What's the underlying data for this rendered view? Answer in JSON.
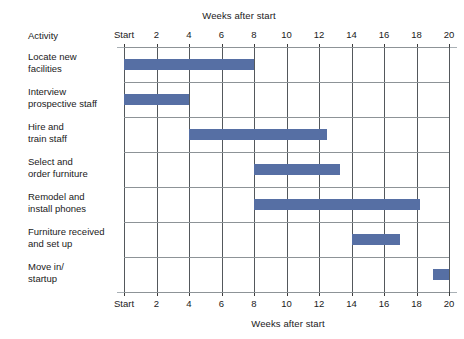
{
  "chart_data": {
    "type": "bar",
    "chart_subtype": "gantt",
    "title": "Weeks after start",
    "xlabel": "Weeks after start",
    "ylabel": "Activity",
    "xlim": [
      0,
      20
    ],
    "grid": true,
    "legend": false,
    "x_tick_values": [
      0,
      2,
      4,
      6,
      8,
      10,
      12,
      14,
      16,
      18,
      20
    ],
    "x_tick_labels": [
      "Start",
      "2",
      "4",
      "6",
      "8",
      "10",
      "12",
      "14",
      "16",
      "18",
      "20"
    ],
    "bar_color": "#566fa4",
    "categories": [
      "Locate new facilities",
      "Interview prospective staff",
      "Hire and train staff",
      "Select and order furniture",
      "Remodel and install phones",
      "Furniture received and set up",
      "Move in/ startup"
    ],
    "tasks": [
      {
        "name": "Locate new facilities",
        "label_lines": [
          "Locate new",
          "facilities"
        ],
        "start": 0,
        "end": 8,
        "duration": 8
      },
      {
        "name": "Interview prospective staff",
        "label_lines": [
          "Interview",
          "prospective staff"
        ],
        "start": 0,
        "end": 4,
        "duration": 4
      },
      {
        "name": "Hire and train staff",
        "label_lines": [
          "Hire and",
          "train staff"
        ],
        "start": 4,
        "end": 12.5,
        "duration": 8.5
      },
      {
        "name": "Select and order furniture",
        "label_lines": [
          "Select and",
          "order furniture"
        ],
        "start": 8,
        "end": 13.3,
        "duration": 5.3
      },
      {
        "name": "Remodel and install phones",
        "label_lines": [
          "Remodel and",
          "install phones"
        ],
        "start": 8,
        "end": 18.2,
        "duration": 10.2
      },
      {
        "name": "Furniture received and set up",
        "label_lines": [
          "Furniture received",
          "and set up"
        ],
        "start": 14,
        "end": 17,
        "duration": 3
      },
      {
        "name": "Move in/ startup",
        "label_lines": [
          "Move in/",
          "startup"
        ],
        "start": 19,
        "end": 20,
        "duration": 1
      }
    ]
  },
  "labels": {
    "activity_header": "Activity",
    "axis_title_top": "Weeks after start",
    "axis_title_bottom": "Weeks after start"
  }
}
